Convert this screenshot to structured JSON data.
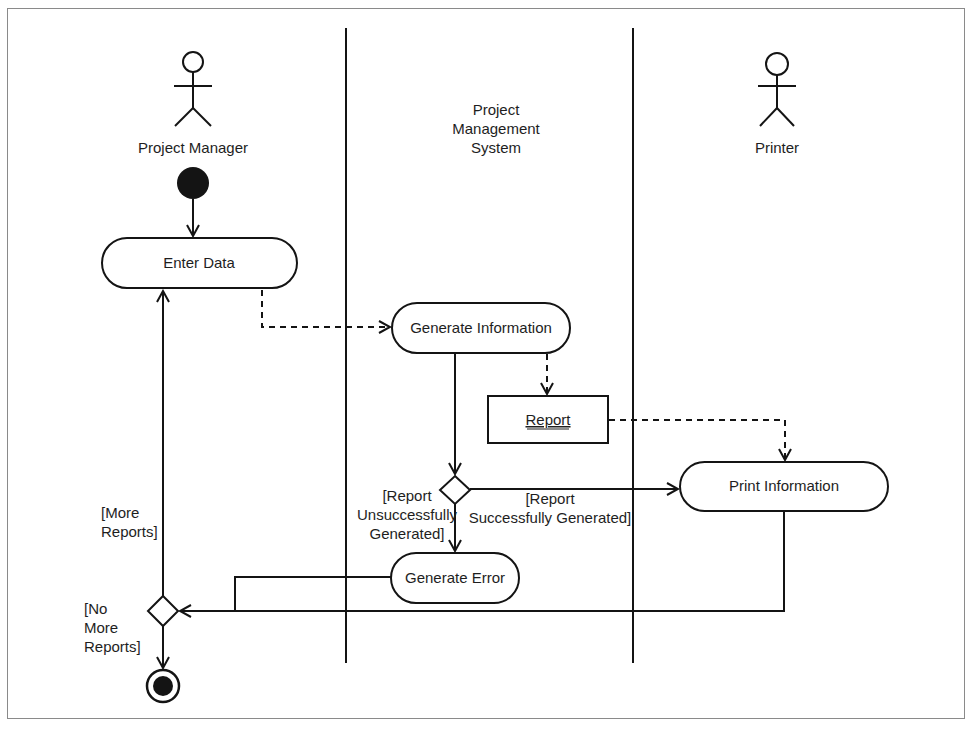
{
  "diagram": {
    "type": "UML activity diagram with swimlanes",
    "swimlanes": [
      {
        "id": "pm",
        "label": "Project Manager",
        "actor_icon": "stick-figure-icon"
      },
      {
        "id": "pms",
        "label_lines": [
          "Project",
          "Management",
          "System"
        ],
        "actor_icon": null
      },
      {
        "id": "printer",
        "label": "Printer",
        "actor_icon": "stick-figure-icon"
      }
    ],
    "nodes": {
      "initial": {
        "kind": "initial-node"
      },
      "enter_data": {
        "kind": "action",
        "label": "Enter Data",
        "lane": "pm"
      },
      "generate_information": {
        "kind": "action",
        "label": "Generate Information",
        "lane": "pms"
      },
      "report": {
        "kind": "object",
        "label": "Report",
        "lane": "pms"
      },
      "decision_report": {
        "kind": "decision",
        "lane": "pms"
      },
      "generate_error": {
        "kind": "action",
        "label": "Generate Error",
        "lane": "pms"
      },
      "print_information": {
        "kind": "action",
        "label": "Print Information",
        "lane": "printer"
      },
      "decision_more": {
        "kind": "decision",
        "lane": "pm"
      },
      "final": {
        "kind": "final-node"
      }
    },
    "guards": {
      "unsuccessful": [
        "[Report",
        "Unsuccessfully",
        "Generated]"
      ],
      "successful": [
        "[Report",
        "Successfully Generated]"
      ],
      "more_reports": [
        "[More",
        "Reports]"
      ],
      "no_more_reports": [
        "[No",
        "More",
        "Reports]"
      ]
    },
    "edges": [
      {
        "from": "initial",
        "to": "enter_data",
        "style": "solid"
      },
      {
        "from": "enter_data",
        "to": "generate_information",
        "style": "dashed"
      },
      {
        "from": "generate_information",
        "to": "report",
        "style": "dashed"
      },
      {
        "from": "report",
        "to": "print_information",
        "style": "dashed"
      },
      {
        "from": "generate_information",
        "to": "decision_report",
        "style": "solid"
      },
      {
        "from": "decision_report",
        "to": "print_information",
        "style": "solid",
        "guard": "[Report Successfully Generated]"
      },
      {
        "from": "decision_report",
        "to": "generate_error",
        "style": "solid",
        "guard": "[Report Unsuccessfully Generated]"
      },
      {
        "from": "generate_error",
        "to": "decision_more",
        "style": "solid"
      },
      {
        "from": "print_information",
        "to": "decision_more",
        "style": "solid"
      },
      {
        "from": "decision_more",
        "to": "enter_data",
        "style": "solid",
        "guard": "[More Reports]"
      },
      {
        "from": "decision_more",
        "to": "final",
        "style": "solid",
        "guard": "[No More Reports]"
      }
    ]
  }
}
